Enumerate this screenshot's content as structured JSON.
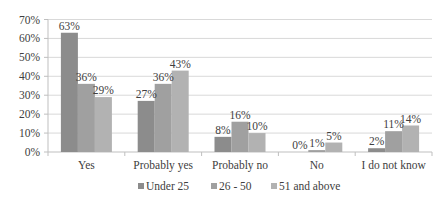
{
  "chart_data": {
    "type": "bar",
    "title": "",
    "xlabel": "",
    "ylabel": "",
    "categories": [
      "Yes",
      "Probably yes",
      "Probably no",
      "No",
      "I do not know"
    ],
    "series": [
      {
        "name": "Under 25",
        "values": [
          63,
          27,
          8,
          0,
          2
        ],
        "color": "#8c8c8c"
      },
      {
        "name": "26 - 50",
        "values": [
          36,
          36,
          16,
          1,
          11
        ],
        "color": "#a0a0a0"
      },
      {
        "name": "51 and above",
        "values": [
          29,
          43,
          10,
          5,
          14
        ],
        "color": "#b2b2b2"
      }
    ],
    "data_labels": [
      [
        "63%",
        "27%",
        "8%",
        "0%",
        "2%"
      ],
      [
        "36%",
        "36%",
        "16%",
        "1%",
        "11%"
      ],
      [
        "29%",
        "43%",
        "10%",
        "5%",
        "14%"
      ]
    ],
    "ylim": [
      0,
      70
    ],
    "yticks": [
      "0%",
      "10%",
      "20%",
      "30%",
      "40%",
      "50%",
      "60%",
      "70%"
    ],
    "grid": true,
    "legend_position": "bottom"
  }
}
